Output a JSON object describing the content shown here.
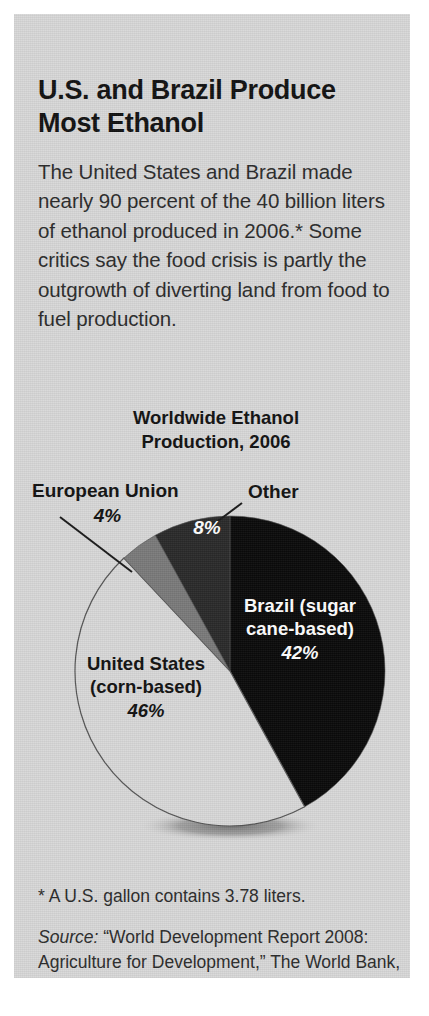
{
  "panel": {
    "background_color": "#d8d8d8"
  },
  "headline": "U.S. and Brazil Produce Most Ethanol",
  "deck": "The United States and Brazil made nearly 90 percent of the 40 billion liters of ethanol produced in 2006.* Some critics say the food crisis is partly the outgrowth of diverting land from food to fuel production.",
  "chart_title_line1": "Worldwide Ethanol",
  "chart_title_line2": "Production, 2006",
  "callouts": {
    "european_union": {
      "label": "European Union",
      "percent": "4%"
    },
    "other": {
      "label": "Other",
      "percent": "8%"
    }
  },
  "wedge_labels": {
    "brazil": {
      "line1": "Brazil (sugar",
      "line2": "cane-based)",
      "percent": "42%"
    },
    "united_states": {
      "line1": "United States",
      "line2": "(corn-based)",
      "percent": "46%"
    }
  },
  "footnote": "* A U.S. gallon contains 3.78 liters.",
  "source": {
    "label": "Source:",
    "text": " “World Development Report 2008: Agriculture for Development,” The World Bank, 2007"
  },
  "chart_data": {
    "type": "pie",
    "title": "Worldwide Ethanol Production, 2006",
    "unit": "percent",
    "total_note": "40 billion liters of ethanol produced in 2006",
    "start_angle_deg": 0,
    "direction": "clockwise",
    "legend": "labels-on-slices-and-callouts",
    "categories": [
      "Brazil (sugar cane-based)",
      "United States (corn-based)",
      "European Union",
      "Other"
    ],
    "values": [
      42,
      46,
      4,
      8
    ],
    "labels": [
      "42%",
      "46%",
      "4%",
      "8%"
    ],
    "colors": [
      "#0a0a0a",
      "#d8d8d8",
      "#7a7a7a",
      "#2a2a2a"
    ],
    "slices": [
      {
        "name": "Brazil (sugar cane-based)",
        "value": 42,
        "label": "42%",
        "color": "#0a0a0a",
        "label_color": "#ffffff",
        "start_deg": 0,
        "end_deg": 151.2
      },
      {
        "name": "United States (corn-based)",
        "value": 46,
        "label": "46%",
        "color": "#d8d8d8",
        "label_color": "#111111",
        "start_deg": 151.2,
        "end_deg": 316.8
      },
      {
        "name": "European Union",
        "value": 4,
        "label": "4%",
        "color": "#7a7a7a",
        "label_color": "#111111",
        "start_deg": 316.8,
        "end_deg": 331.2
      },
      {
        "name": "Other",
        "value": 8,
        "label": "8%",
        "color": "#2a2a2a",
        "label_color": "#ffffff",
        "start_deg": 331.2,
        "end_deg": 360
      }
    ]
  }
}
